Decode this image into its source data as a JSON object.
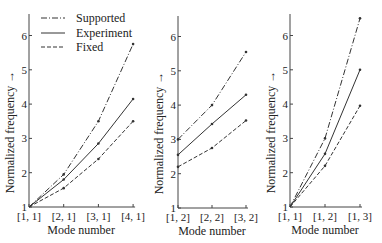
{
  "chart_data": [
    {
      "type": "line",
      "panel": 1,
      "categories": [
        "[1, 1]",
        "[2, 1]",
        "[3, 1]",
        "[4, 1]"
      ],
      "series": [
        {
          "name": "Supported",
          "style": "dash-dot",
          "values": [
            1.0,
            1.95,
            3.5,
            5.75
          ]
        },
        {
          "name": "Experiment",
          "style": "solid",
          "values": [
            1.0,
            1.8,
            2.85,
            4.15
          ]
        },
        {
          "name": "Fixed",
          "style": "dashed",
          "values": [
            1.0,
            1.55,
            2.4,
            3.5
          ]
        }
      ],
      "xlabel": "Mode number",
      "ylabel": "Normalized frequency →",
      "yticks": [
        1,
        2,
        3,
        4,
        5,
        6
      ],
      "ylim": [
        1,
        6.5
      ],
      "grid": false,
      "legend": {
        "position": "top-left",
        "entries": [
          "Supported",
          "Experiment",
          "Fixed"
        ]
      }
    },
    {
      "type": "line",
      "panel": 2,
      "categories": [
        "[1, 2]",
        "[2, 2]",
        "[3, 2]"
      ],
      "series": [
        {
          "name": "Supported",
          "style": "dash-dot",
          "values": [
            3.0,
            4.0,
            5.55
          ]
        },
        {
          "name": "Experiment",
          "style": "solid",
          "values": [
            2.55,
            3.45,
            4.3
          ]
        },
        {
          "name": "Fixed",
          "style": "dashed",
          "values": [
            2.2,
            2.75,
            3.55
          ]
        }
      ],
      "xlabel": "Mode number",
      "ylabel": "Normalized frequency →",
      "yticks": [
        1,
        2,
        3,
        4,
        5,
        6
      ],
      "ylim": [
        1,
        6.5
      ],
      "grid": false
    },
    {
      "type": "line",
      "panel": 3,
      "categories": [
        "[1, 1]",
        "[1, 2]",
        "[1, 3]"
      ],
      "series": [
        {
          "name": "Supported",
          "style": "dash-dot",
          "values": [
            1.0,
            3.0,
            6.5
          ]
        },
        {
          "name": "Experiment",
          "style": "solid",
          "values": [
            1.0,
            2.55,
            5.0
          ]
        },
        {
          "name": "Fixed",
          "style": "dashed",
          "values": [
            1.0,
            2.2,
            3.95
          ]
        }
      ],
      "xlabel": "Mode number",
      "ylabel": "Normalized frequency →",
      "yticks": [
        1,
        2,
        3,
        4,
        5,
        6
      ],
      "ylim": [
        1,
        6.5
      ],
      "grid": false
    }
  ],
  "legend": {
    "supported": "Supported",
    "experiment": "Experiment",
    "fixed": "Fixed"
  },
  "colors": {
    "line": "#333333",
    "axis": "#444444"
  }
}
